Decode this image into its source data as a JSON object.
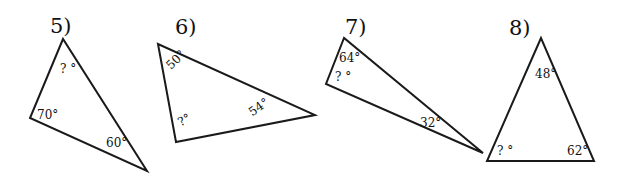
{
  "problems": [
    {
      "number": "5)",
      "angles": {
        "top": "? °",
        "left": "70°",
        "right": "60°"
      }
    },
    {
      "number": "6)",
      "angles": {
        "top": "50°",
        "bottom": "?°",
        "right": "54°"
      }
    },
    {
      "number": "7)",
      "angles": {
        "top": "64°",
        "left": "? °",
        "right": "32°"
      }
    },
    {
      "number": "8)",
      "angles": {
        "top": "48°",
        "left": "? °",
        "right": "62°"
      }
    }
  ]
}
